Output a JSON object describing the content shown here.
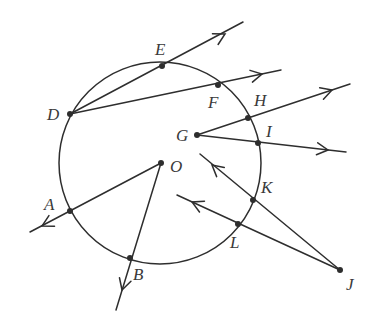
{
  "diagram": {
    "circle": {
      "name": "circle-O",
      "cx": 160,
      "cy": 163,
      "r": 101
    },
    "points": [
      {
        "id": "E",
        "x": 162,
        "y": 66,
        "lx": 155,
        "ly": 55
      },
      {
        "id": "F",
        "x": 218,
        "y": 85,
        "lx": 208,
        "ly": 108
      },
      {
        "id": "D",
        "x": 70,
        "y": 114,
        "lx": 47,
        "ly": 120
      },
      {
        "id": "H",
        "x": 248,
        "y": 118,
        "lx": 254,
        "ly": 106
      },
      {
        "id": "G",
        "x": 197,
        "y": 135,
        "lx": 176,
        "ly": 141
      },
      {
        "id": "I",
        "x": 258,
        "y": 143,
        "lx": 266,
        "ly": 137
      },
      {
        "id": "O",
        "x": 161,
        "y": 163,
        "lx": 170,
        "ly": 172
      },
      {
        "id": "K",
        "x": 253,
        "y": 200,
        "lx": 261,
        "ly": 193
      },
      {
        "id": "A",
        "x": 70,
        "y": 211,
        "lx": 44,
        "ly": 210
      },
      {
        "id": "L",
        "x": 238,
        "y": 224,
        "lx": 230,
        "ly": 248
      },
      {
        "id": "B",
        "x": 130,
        "y": 258,
        "lx": 133,
        "ly": 280
      },
      {
        "id": "J",
        "x": 340,
        "y": 270,
        "lx": 346,
        "ly": 290
      }
    ],
    "rays": [
      {
        "name": "ray-DE",
        "from": "D",
        "x1": 70,
        "y1": 114,
        "x2": 243,
        "y2": 22,
        "arrow": [
          225,
          34
        ]
      },
      {
        "name": "ray-DF",
        "from": "D",
        "x1": 70,
        "y1": 114,
        "x2": 281,
        "y2": 70,
        "arrow": [
          262,
          74
        ]
      },
      {
        "name": "ray-GH",
        "from": "G",
        "x1": 197,
        "y1": 135,
        "x2": 350,
        "y2": 84,
        "arrow": [
          332,
          90
        ]
      },
      {
        "name": "ray-GI",
        "from": "G",
        "x1": 197,
        "y1": 135,
        "x2": 346,
        "y2": 152,
        "arrow": [
          328,
          150
        ]
      },
      {
        "name": "ray-OA",
        "from": "O",
        "x1": 161,
        "y1": 163,
        "x2": 30,
        "y2": 232,
        "arrow": [
          42,
          226
        ]
      },
      {
        "name": "ray-OB",
        "from": "O",
        "x1": 161,
        "y1": 163,
        "x2": 116,
        "y2": 310,
        "arrow": [
          122,
          290
        ]
      },
      {
        "name": "ray-JK",
        "from": "J",
        "x1": 340,
        "y1": 270,
        "x2": 200,
        "y2": 154,
        "arrow": [
          212,
          165
        ]
      },
      {
        "name": "ray-JL",
        "from": "J",
        "x1": 340,
        "y1": 270,
        "x2": 177,
        "y2": 195,
        "arrow": [
          192,
          202
        ]
      }
    ]
  }
}
